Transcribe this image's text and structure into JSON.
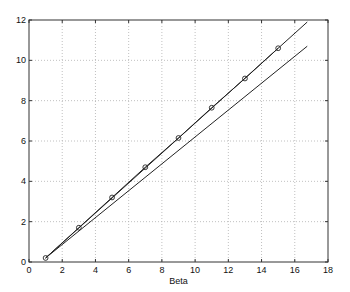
{
  "chart_data": {
    "type": "line",
    "title": "",
    "xlabel": "Beta",
    "ylabel": "",
    "xlim": [
      0,
      18
    ],
    "ylim": [
      0,
      12
    ],
    "xticks": [
      0,
      2,
      4,
      6,
      8,
      10,
      12,
      14,
      16,
      18
    ],
    "yticks": [
      0,
      2,
      4,
      6,
      8,
      10,
      12
    ],
    "grid": true,
    "legend": null,
    "series": [
      {
        "name": "data-points",
        "style": "line-with-circle-markers",
        "x": [
          1,
          3,
          5,
          7,
          9,
          11,
          13,
          15
        ],
        "y": [
          0.2,
          1.7,
          3.2,
          4.7,
          6.15,
          7.65,
          9.1,
          10.6
        ]
      },
      {
        "name": "upper-fit-line",
        "style": "line",
        "x": [
          1,
          16.75
        ],
        "y": [
          0.2,
          11.9
        ]
      },
      {
        "name": "lower-fit-line",
        "style": "line",
        "x": [
          1,
          16.75
        ],
        "y": [
          0.2,
          10.7
        ]
      }
    ]
  },
  "colors": {
    "line": "#222222",
    "grid": "#b0b0b0",
    "axis": "#333333",
    "background": "#ffffff"
  }
}
